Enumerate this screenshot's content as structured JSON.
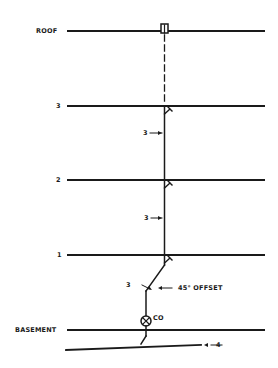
{
  "diagram": {
    "type": "plumbing-riser",
    "floors": [
      {
        "label": "ROOF",
        "y": 31
      },
      {
        "label": "3",
        "y": 106
      },
      {
        "label": "2",
        "y": 180
      },
      {
        "label": "1",
        "y": 255
      },
      {
        "label": "BASEMENT",
        "y": 330
      }
    ],
    "annotations": {
      "pipe_size_3a": "3",
      "pipe_size_2a": "3",
      "pipe_size_1a": "3",
      "offset_label": "45° OFFSET",
      "cleanout_label": "CO",
      "drain_size": "4"
    },
    "colors": {
      "line": "#1a1a1a",
      "background": "#ffffff"
    }
  }
}
